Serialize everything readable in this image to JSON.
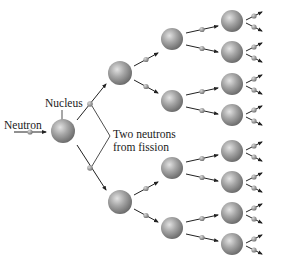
{
  "labels": {
    "neutron": "Neutron",
    "nucleus": "Nucleus",
    "fission_line1": "Two neutrons",
    "fission_line2": "from fission"
  },
  "colors": {
    "nucleus_light": "#d4d4d4",
    "nucleus_mid": "#9a9a9a",
    "nucleus_dark": "#6e6e6e",
    "neutron": "#8a8a8a",
    "line": "#222222"
  },
  "chain": {
    "generations": [
      {
        "name": "gen-1",
        "nuclei": [
          [
            63,
            131
          ]
        ],
        "radius": 12
      },
      {
        "name": "gen-2",
        "nuclei": [
          [
            120,
            73
          ],
          [
            120,
            202
          ]
        ],
        "radius": 12
      },
      {
        "name": "gen-3",
        "nuclei": [
          [
            172,
            39
          ],
          [
            172,
            101
          ],
          [
            172,
            168
          ],
          [
            172,
            228
          ]
        ],
        "radius": 11
      },
      {
        "name": "gen-4",
        "nuclei": [
          [
            232,
            21
          ],
          [
            232,
            52
          ],
          [
            232,
            84
          ],
          [
            232,
            115
          ],
          [
            232,
            151
          ],
          [
            232,
            182
          ],
          [
            232,
            213
          ],
          [
            232,
            244
          ]
        ],
        "radius": 11
      }
    ]
  }
}
